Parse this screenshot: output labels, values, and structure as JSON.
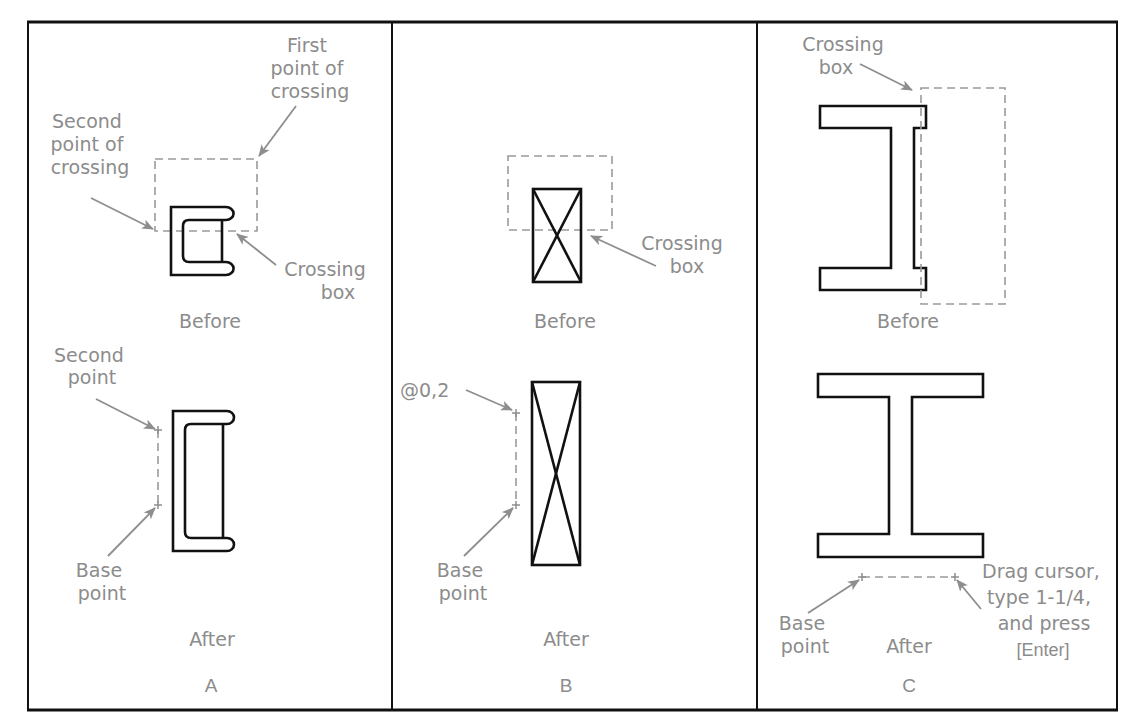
{
  "figure": {
    "panels": [
      {
        "id": "A",
        "label": "A",
        "before_caption": "Before",
        "after_caption": "After",
        "annotations": {
          "first_point": [
            "First",
            "point of",
            "crossing"
          ],
          "second_point": [
            "Second",
            "point of",
            "crossing"
          ],
          "crossing_box": [
            "Crossing",
            "box"
          ],
          "second_point_after": [
            "Second",
            "point"
          ],
          "base_point": [
            "Base",
            "point"
          ]
        }
      },
      {
        "id": "B",
        "label": "B",
        "before_caption": "Before",
        "after_caption": "After",
        "annotations": {
          "crossing_box": [
            "Crossing",
            "box"
          ],
          "coordinate": "@0,2",
          "base_point": [
            "Base",
            "point"
          ]
        }
      },
      {
        "id": "C",
        "label": "C",
        "before_caption": "Before",
        "after_caption": "After",
        "annotations": {
          "crossing_box": [
            "Crossing",
            "box"
          ],
          "base_point": [
            "Base",
            "point"
          ],
          "instruction": [
            "Drag cursor,",
            "type 1-1/4,",
            "and press"
          ],
          "key": "[Enter]"
        }
      }
    ],
    "colors": {
      "object_stroke": "#111111",
      "annotation": "#8c8c8c",
      "background": "#ffffff"
    }
  }
}
